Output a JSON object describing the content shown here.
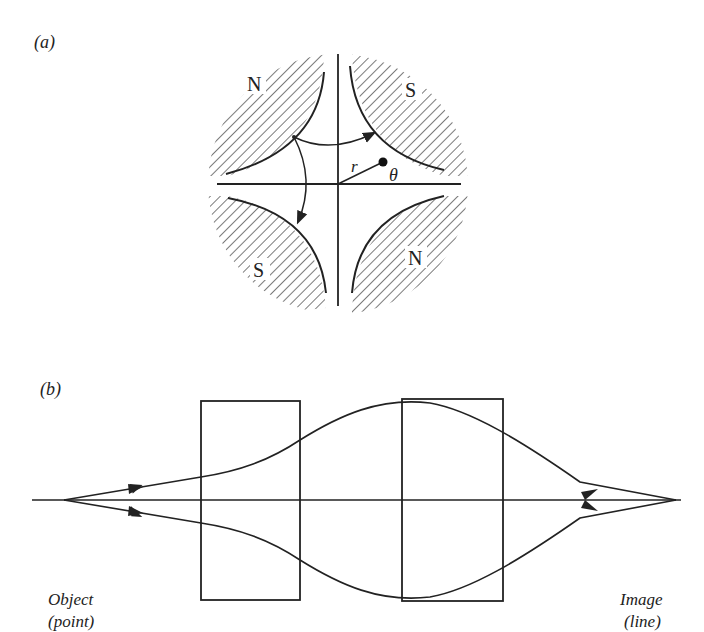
{
  "panel_a": {
    "label": "(a)",
    "poles": [
      {
        "position": "top-left",
        "label": "N"
      },
      {
        "position": "top-right",
        "label": "S"
      },
      {
        "position": "bottom-left",
        "label": "S"
      },
      {
        "position": "bottom-right",
        "label": "N"
      }
    ],
    "radius_label": "r",
    "angle_label": "θ"
  },
  "panel_b": {
    "label": "(b)",
    "object_label_line1": "Object",
    "object_label_line2": "(point)",
    "image_label_line1": "Image",
    "image_label_line2": "(line)"
  },
  "colors": {
    "ink": "#222222",
    "background": "#ffffff"
  }
}
